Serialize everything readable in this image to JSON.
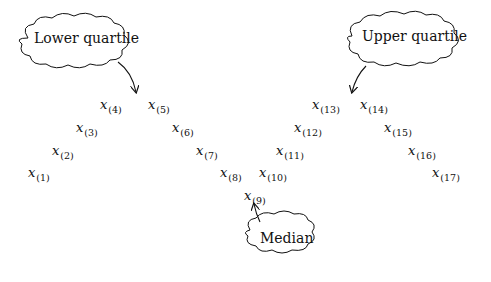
{
  "diagram": {
    "variable": "x",
    "observations": [
      {
        "index": "(1)",
        "x": 28,
        "y": 165
      },
      {
        "index": "(2)",
        "x": 52,
        "y": 143
      },
      {
        "index": "(3)",
        "x": 76,
        "y": 120
      },
      {
        "index": "(4)",
        "x": 100,
        "y": 97
      },
      {
        "index": "(5)",
        "x": 148,
        "y": 97
      },
      {
        "index": "(6)",
        "x": 172,
        "y": 120
      },
      {
        "index": "(7)",
        "x": 196,
        "y": 143
      },
      {
        "index": "(8)",
        "x": 220,
        "y": 165
      },
      {
        "index": "(9)",
        "x": 244,
        "y": 188
      },
      {
        "index": "(10)",
        "x": 259,
        "y": 165
      },
      {
        "index": "(11)",
        "x": 276,
        "y": 143
      },
      {
        "index": "(12)",
        "x": 294,
        "y": 120
      },
      {
        "index": "(13)",
        "x": 312,
        "y": 97
      },
      {
        "index": "(14)",
        "x": 360,
        "y": 97
      },
      {
        "index": "(15)",
        "x": 384,
        "y": 120
      },
      {
        "index": "(16)",
        "x": 408,
        "y": 143
      },
      {
        "index": "(17)",
        "x": 432,
        "y": 165
      }
    ],
    "callouts": {
      "lower_quartile": "Lower quartile",
      "upper_quartile": "Upper quartile",
      "median": "Median"
    }
  }
}
